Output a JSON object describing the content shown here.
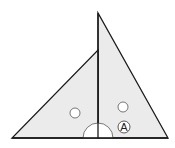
{
  "diagram": {
    "type": "geometry",
    "colors": {
      "fill": "#ebebeb",
      "stroke": "#1a1a1a",
      "background": "#ffffff"
    },
    "shapes": {
      "right_triangle": {
        "points": [
          [
            98,
            13
          ],
          [
            98,
            138
          ],
          [
            168,
            138
          ]
        ]
      },
      "left_triangle": {
        "points": [
          [
            98,
            50
          ],
          [
            98,
            138
          ],
          [
            12,
            138
          ]
        ]
      },
      "base_line": {
        "x1": 12,
        "y1": 138,
        "x2": 168,
        "y2": 138
      },
      "vertical_segment": {
        "x1": 98,
        "y1": 13,
        "x2": 98,
        "y2": 138
      }
    },
    "markers": [
      {
        "kind": "circle-angle-mark",
        "cx": 75,
        "cy": 113,
        "r": 5
      },
      {
        "kind": "circle-angle-mark",
        "cx": 123,
        "cy": 107,
        "r": 5
      },
      {
        "kind": "semicircle-right-angle-mark",
        "cx": 98,
        "cy": 138,
        "r": 15
      }
    ],
    "labels": [
      {
        "text": "A",
        "circled": true,
        "cx": 124,
        "cy": 127
      }
    ]
  }
}
